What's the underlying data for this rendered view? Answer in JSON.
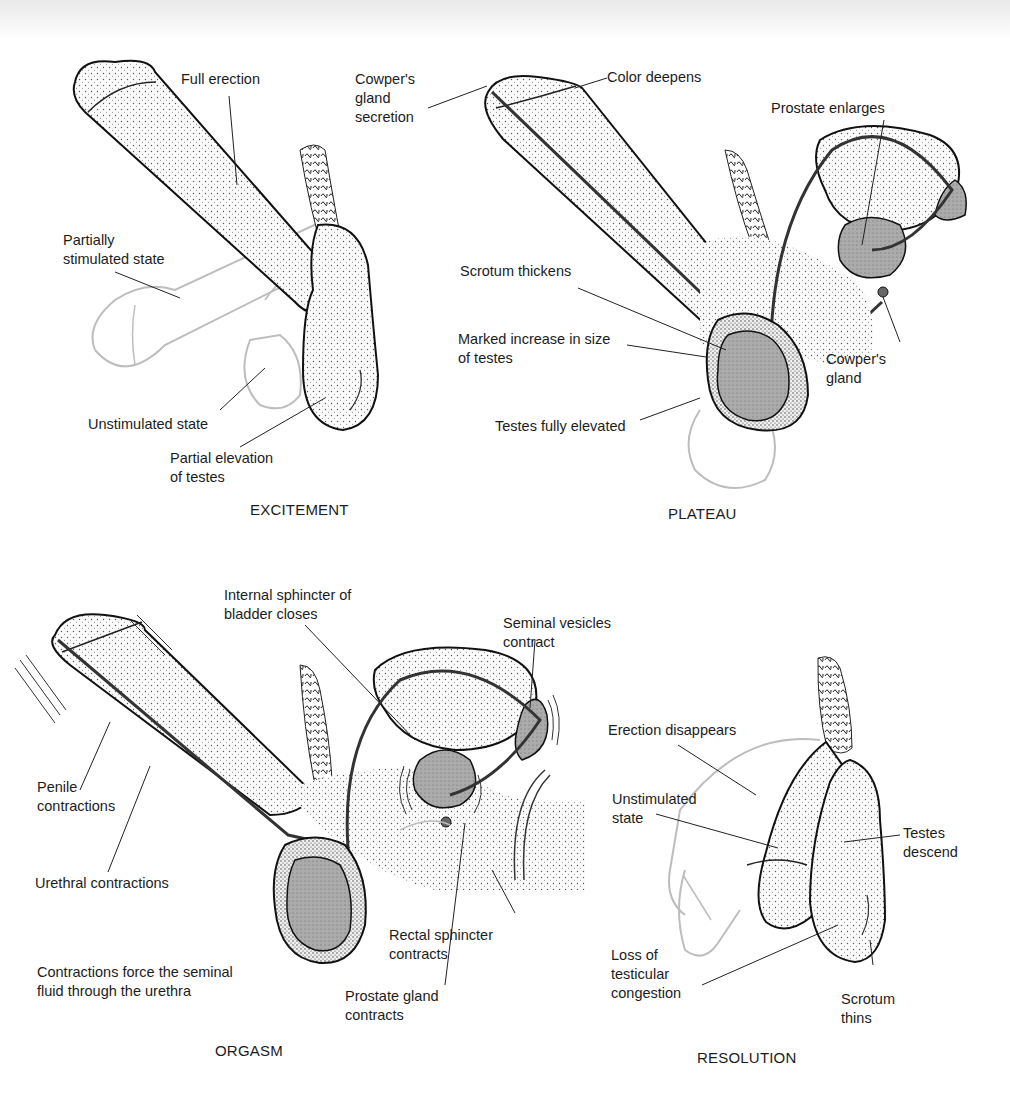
{
  "figure": {
    "panels": [
      {
        "stage": "EXCITEMENT",
        "labels": {
          "full_erection": "Full erection",
          "partially_stimulated": "Partially\nstimulated state",
          "unstimulated": "Unstimulated state",
          "partial_elevation": "Partial elevation\nof testes"
        }
      },
      {
        "stage": "PLATEAU",
        "labels": {
          "cowpers_secretion": "Cowper's\ngland\nsecretion",
          "color_deepens": "Color deepens",
          "prostate_enlarges": "Prostate enlarges",
          "scrotum_thickens": "Scrotum thickens",
          "marked_increase": "Marked increase in size\nof testes",
          "cowpers_gland": "Cowper's\ngland",
          "testes_elevated": "Testes fully elevated"
        }
      },
      {
        "stage": "ORGASM",
        "labels": {
          "internal_sphincter": "Internal sphincter of\nbladder closes",
          "seminal_vesicles": "Seminal vesicles\ncontract",
          "penile_contractions": "Penile\ncontractions",
          "urethral_contractions": "Urethral contractions",
          "contractions_force": "Contractions force the seminal\nfluid through the urethra",
          "rectal_sphincter": "Rectal sphincter\ncontracts",
          "prostate_contracts": "Prostate gland\ncontracts"
        }
      },
      {
        "stage": "RESOLUTION",
        "labels": {
          "erection_disappears": "Erection disappears",
          "unstimulated": "Unstimulated\nstate",
          "testes_descend": "Testes\ndescend",
          "loss_congestion": "Loss of\ntesticular\ncongestion",
          "scrotum_thins": "Scrotum\nthins"
        }
      }
    ],
    "colors": {
      "ink": "#1c1c1c",
      "ghost_outline": "#b8b8b8",
      "shaded_organ": "#a9a9a9",
      "stipple_fill": "#f1f1f1"
    }
  }
}
